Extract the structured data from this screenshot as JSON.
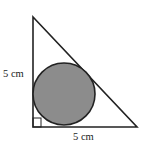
{
  "diagram": {
    "type": "right triangle with inscribed circle",
    "labels": {
      "left_side": "5 cm",
      "bottom_side": "5 cm"
    },
    "colors": {
      "stroke": "#222222",
      "circle_fill": "#8c8c8c",
      "background": "#ffffff"
    }
  }
}
